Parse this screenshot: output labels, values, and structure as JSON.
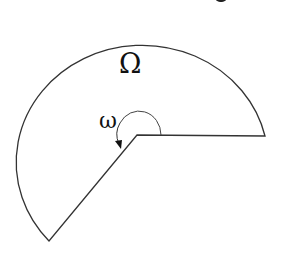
{
  "diagram": {
    "type": "domain-with-reentrant-corner",
    "domain_label": "Ω",
    "angle_label": "ω",
    "colors": {
      "stroke": "#333333",
      "background": "#ffffff"
    }
  }
}
